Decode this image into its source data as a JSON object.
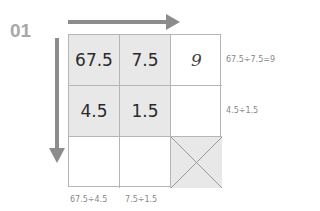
{
  "label": "01",
  "grid": {
    "cells": [
      [
        "67.5",
        "7.5",
        "9"
      ],
      [
        "4.5",
        "1.5",
        ""
      ],
      [
        "",
        "",
        ""
      ]
    ]
  },
  "notes": {
    "row1": "67.5÷7.5=9",
    "row2": "4.5÷1.5",
    "col1": "67.5÷4.5",
    "col2": "7.5÷1.5"
  },
  "colors": {
    "arrow": "#8c8c8c",
    "shade": "#e8e8e8",
    "border": "#b5b5b5"
  }
}
